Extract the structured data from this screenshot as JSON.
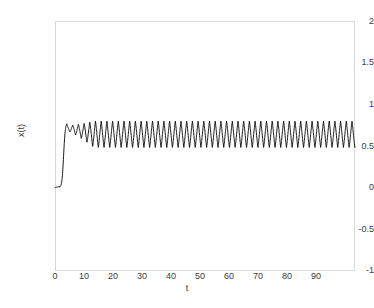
{
  "chart_data": {
    "type": "line",
    "title": "",
    "xlabel": "t",
    "ylabel": "x(t)",
    "xlim": [
      0,
      100
    ],
    "ylim": [
      -1,
      2
    ],
    "grid": false,
    "legend": null,
    "line_color": "#000000",
    "xticks": [
      0,
      10,
      20,
      30,
      40,
      50,
      60,
      70,
      80,
      90
    ],
    "xtick_labels": [
      "0",
      "10",
      "20",
      "30",
      "40",
      "50",
      "60",
      "70",
      "80",
      "90"
    ],
    "yticks": [
      -1,
      -0.5,
      0,
      0.5,
      1,
      1.5,
      2
    ],
    "ytick_labels": [
      "-1",
      "-0.5",
      "0",
      "0.5",
      "1",
      "1.5",
      "2"
    ],
    "series": [
      {
        "name": "x(t)",
        "description": "Relaxation-oscillator response: starts at x=0, stays flat until t~1.5, rises steeply to ~0.78 by t~4, small ripples that grow to a steady limit cycle from t~13 onward.",
        "initial_value": 0.0,
        "rise_start_t": 1.5,
        "rise_end_t": 4.0,
        "rise_end_value": 0.78,
        "transient_end_t": 13.0,
        "steady_peak": 0.8,
        "steady_trough": 0.48,
        "steady_mean": 0.64,
        "steady_amplitude": 0.16,
        "period": 1.9,
        "ripple_peak_early": 0.75,
        "ripple_trough_early": 0.68,
        "t_end": 100
      }
    ]
  },
  "axes": {
    "frame_color": "#d8d8d8",
    "tick_text_color": "#3a3a3a"
  }
}
